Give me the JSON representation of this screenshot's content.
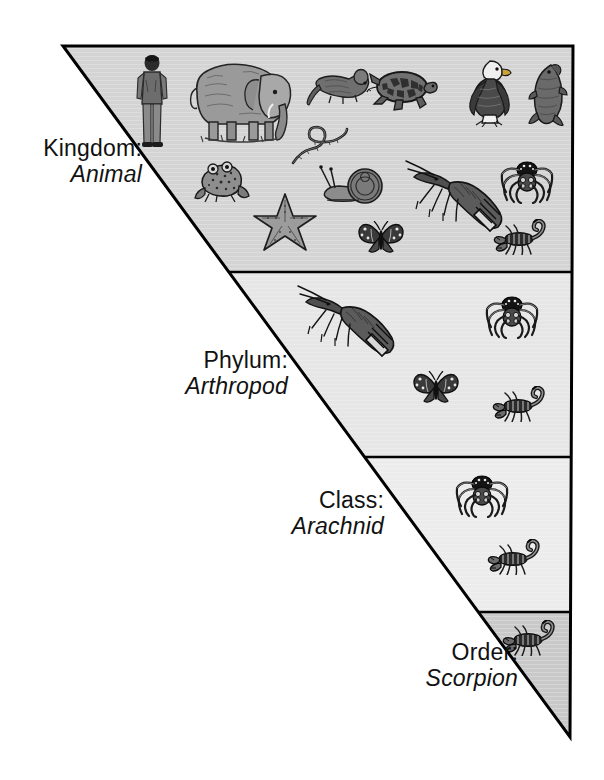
{
  "figure": {
    "background_color": "#ffffff",
    "outline_color": "#000000"
  },
  "triangle": {
    "apex_top_left": [
      63,
      46
    ],
    "top_right": [
      573,
      46
    ],
    "bottom_vertex": [
      570,
      737
    ]
  },
  "bands": [
    {
      "id": "kingdom",
      "rank": "Kingdom:",
      "taxon": "Animal",
      "fill": "#d4d4d4",
      "top": 46,
      "bottom": 272,
      "organisms": [
        {
          "name": "human",
          "x": 152,
          "y": 102,
          "w": 42,
          "h": 96
        },
        {
          "name": "elephant",
          "x": 243,
          "y": 98,
          "w": 108,
          "h": 92
        },
        {
          "name": "mouse",
          "x": 338,
          "y": 86,
          "w": 66,
          "h": 42
        },
        {
          "name": "turtle",
          "x": 402,
          "y": 90,
          "w": 72,
          "h": 48
        },
        {
          "name": "eagle",
          "x": 490,
          "y": 92,
          "w": 52,
          "h": 70
        },
        {
          "name": "fish",
          "x": 548,
          "y": 95,
          "w": 42,
          "h": 68
        },
        {
          "name": "worm",
          "x": 320,
          "y": 144,
          "w": 62,
          "h": 46
        },
        {
          "name": "frog",
          "x": 222,
          "y": 180,
          "w": 58,
          "h": 44
        },
        {
          "name": "starfish",
          "x": 285,
          "y": 222,
          "w": 66,
          "h": 60
        },
        {
          "name": "snail",
          "x": 352,
          "y": 184,
          "w": 70,
          "h": 44
        },
        {
          "name": "butterfly",
          "x": 380,
          "y": 237,
          "w": 46,
          "h": 32
        },
        {
          "name": "lobster",
          "x": 452,
          "y": 190,
          "w": 96,
          "h": 66
        },
        {
          "name": "spider",
          "x": 527,
          "y": 180,
          "w": 54,
          "h": 44
        },
        {
          "name": "scorpion",
          "x": 520,
          "y": 234,
          "w": 50,
          "h": 30
        }
      ]
    },
    {
      "id": "phylum",
      "rank": "Phylum:",
      "taxon": "Arthropod",
      "fill": "#e6e6e6",
      "top": 272,
      "bottom": 457,
      "organisms": [
        {
          "name": "lobster",
          "x": 352,
          "y": 320,
          "w": 112,
          "h": 76
        },
        {
          "name": "spider",
          "x": 512,
          "y": 316,
          "w": 54,
          "h": 44
        },
        {
          "name": "butterfly",
          "x": 436,
          "y": 388,
          "w": 48,
          "h": 34
        },
        {
          "name": "scorpion",
          "x": 520,
          "y": 402,
          "w": 52,
          "h": 32
        }
      ]
    },
    {
      "id": "class",
      "rank": "Class:",
      "taxon": "Arachnid",
      "fill": "#ececec",
      "top": 457,
      "bottom": 612,
      "organisms": [
        {
          "name": "spider",
          "x": 482,
          "y": 495,
          "w": 56,
          "h": 46
        },
        {
          "name": "scorpion",
          "x": 515,
          "y": 556,
          "w": 54,
          "h": 34
        }
      ]
    },
    {
      "id": "order",
      "rank": "Order:",
      "taxon": "Scorpion",
      "fill": "#c9c9c9",
      "top": 612,
      "bottom": 737,
      "organisms": [
        {
          "name": "scorpion",
          "x": 530,
          "y": 637,
          "w": 56,
          "h": 36
        }
      ]
    }
  ]
}
